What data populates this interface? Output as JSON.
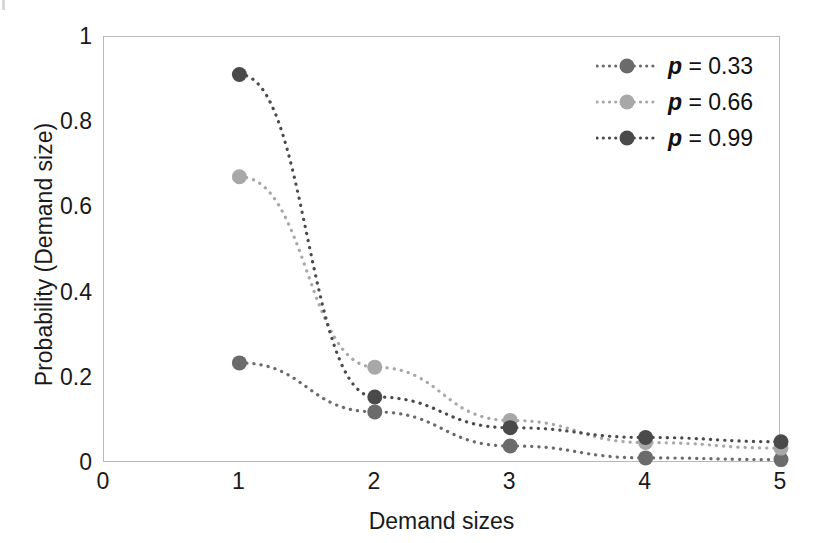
{
  "chart_data": {
    "type": "scatter",
    "title": "",
    "xlabel": "Demand sizes",
    "ylabel": "Probability (Demand size)",
    "x": [
      1,
      2,
      3,
      4,
      5
    ],
    "xlim": [
      0,
      5
    ],
    "ylim": [
      0,
      1
    ],
    "xticks": [
      "0",
      "1",
      "2",
      "3",
      "4",
      "5"
    ],
    "yticks": [
      "0",
      "0.2",
      "0.4",
      "0.6",
      "0.8",
      "1"
    ],
    "grid": false,
    "legend_position": "top-right",
    "line_style": "dotted",
    "marker": "circle",
    "series": [
      {
        "name": "p = 0.33",
        "label_var": "p",
        "label_value": "= 0.33",
        "color": "#6b6b6b",
        "values": [
          0.235,
          0.12,
          0.04,
          0.012,
          0.008
        ]
      },
      {
        "name": "p = 0.66",
        "label_var": "p",
        "label_value": "= 0.66",
        "color": "#a8a8a8",
        "values": [
          0.672,
          0.225,
          0.1,
          0.048,
          0.035
        ]
      },
      {
        "name": "p = 0.99",
        "label_var": "p",
        "label_value": "= 0.99",
        "color": "#4a4a4a",
        "values": [
          0.912,
          0.155,
          0.083,
          0.06,
          0.05
        ]
      }
    ]
  },
  "axes": {
    "frame_color": "#b9b9b9",
    "text_color": "#1a1a1a"
  },
  "legend": {
    "rows": [
      {
        "var": "p",
        "rest": "= 0.33"
      },
      {
        "var": "p",
        "rest": "= 0.66"
      },
      {
        "var": "p",
        "rest": "= 0.99"
      }
    ]
  }
}
